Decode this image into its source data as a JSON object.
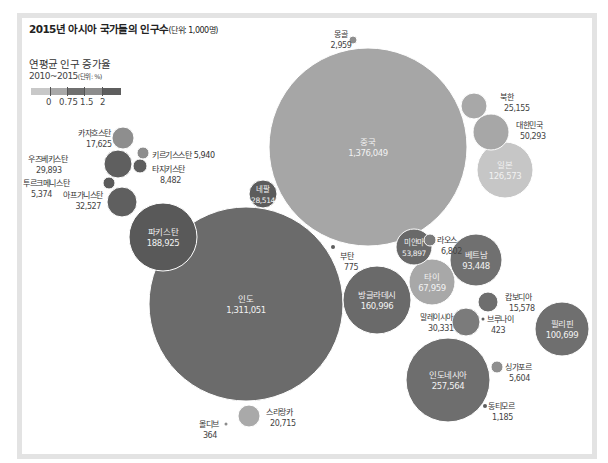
{
  "chart_data": {
    "type": "bubble",
    "title": "2015년 아시아 국가들의 인구수",
    "title_unit": "(단위: 1,000명)",
    "legend": {
      "title": "연평균 인구 증가율",
      "subtitle": "2010~2015",
      "subtitle_unit": "(단위: %)",
      "ticks": [
        "0",
        "0.75",
        "1.5",
        "2"
      ],
      "colors": [
        "#c8c8c8",
        "#a9a9a9",
        "#6f6f6f",
        "#8c8c8c",
        "#5e5e5e"
      ]
    },
    "series": [
      {
        "name": "중국",
        "value": "1,376,049",
        "x": 368,
        "y": 147,
        "r": 99,
        "color": "#a6a6a6",
        "label_inside": true
      },
      {
        "name": "인도",
        "value": "1,311,051",
        "x": 246,
        "y": 304,
        "r": 97,
        "color": "#6b6b6b",
        "label_inside": true
      },
      {
        "name": "파키스탄",
        "value": "188,925",
        "x": 163,
        "y": 237,
        "r": 34,
        "color": "#595959",
        "label_inside": true
      },
      {
        "name": "인도네시아",
        "value": "257,564",
        "x": 448,
        "y": 380,
        "r": 42,
        "color": "#6e6e6e",
        "label_inside": true
      },
      {
        "name": "방글라데시",
        "value": "160,996",
        "x": 377,
        "y": 300,
        "r": 34,
        "color": "#6a6a6a",
        "label_inside": true
      },
      {
        "name": "일본",
        "value": "126,573",
        "x": 505,
        "y": 170,
        "r": 28,
        "color": "#c6c6c6",
        "label_inside": true
      },
      {
        "name": "필리핀",
        "value": "100,699",
        "x": 562,
        "y": 329,
        "r": 27,
        "color": "#6f6f6f",
        "label_inside": true
      },
      {
        "name": "베트남",
        "value": "93,448",
        "x": 476,
        "y": 260,
        "r": 26,
        "color": "#707070",
        "label_inside": true
      },
      {
        "name": "타이",
        "value": "67,959",
        "x": 432,
        "y": 282,
        "r": 23,
        "color": "#a8a8a8",
        "label_inside": true
      },
      {
        "name": "미얀마",
        "value": "53,897",
        "x": 414,
        "y": 247,
        "r": 18,
        "color": "#696969",
        "label_inside": true
      },
      {
        "name": "대한민국",
        "value": "50,293",
        "x": 491,
        "y": 132,
        "r": 18,
        "color": "#a7a7a7",
        "label_inside": false,
        "lx": 516,
        "ly": 128,
        "anchor": "start"
      },
      {
        "name": "아프가니스탄",
        "value": "32,527",
        "x": 122,
        "y": 202,
        "r": 15,
        "color": "#5f5f5f",
        "label_inside": false,
        "lx": 103,
        "ly": 198,
        "anchor": "end"
      },
      {
        "name": "말레이시아",
        "value": "30,331",
        "x": 466,
        "y": 322,
        "r": 14,
        "color": "#7b7b7b",
        "label_inside": false,
        "lx": 420,
        "ly": 320,
        "anchor": "start"
      },
      {
        "name": "우즈베키스탄",
        "value": "29,893",
        "x": 118,
        "y": 164,
        "r": 14,
        "color": "#5f5f5f",
        "label_inside": false,
        "lx": 28,
        "ly": 162,
        "anchor": "start"
      },
      {
        "name": "네팔",
        "value": "28,514",
        "x": 263,
        "y": 194,
        "r": 14,
        "color": "#5c5c5c",
        "label_inside": true
      },
      {
        "name": "북한",
        "value": "25,155",
        "x": 474,
        "y": 106,
        "r": 13,
        "color": "#a8a8a8",
        "label_inside": false,
        "lx": 500,
        "ly": 100,
        "anchor": "start"
      },
      {
        "name": "스리랑카",
        "value": "20,715",
        "x": 249,
        "y": 416,
        "r": 11,
        "color": "#a9a9a9",
        "label_inside": false,
        "lx": 266,
        "ly": 415,
        "anchor": "start"
      },
      {
        "name": "카자흐스탄",
        "value": "17,625",
        "x": 123,
        "y": 138,
        "r": 11,
        "color": "#8e8e8e",
        "label_inside": false,
        "lx": 78,
        "ly": 136,
        "anchor": "start"
      },
      {
        "name": "캄보디아",
        "value": "15,578",
        "x": 488,
        "y": 302,
        "r": 10,
        "color": "#6e6e6e",
        "label_inside": false,
        "lx": 505,
        "ly": 300,
        "anchor": "start"
      },
      {
        "name": "타지키스탄",
        "value": "8,482",
        "x": 140,
        "y": 166,
        "r": 7,
        "color": "#5e5e5e",
        "label_inside": false,
        "lx": 152,
        "ly": 172,
        "anchor": "start"
      },
      {
        "name": "라오스",
        "value": "6,802",
        "x": 430,
        "y": 240,
        "r": 6,
        "color": "#7a7a7a",
        "label_inside": false,
        "lx": 437,
        "ly": 243,
        "anchor": "start"
      },
      {
        "name": "키르기스스탄",
        "value": "5,940",
        "x": 143,
        "y": 153,
        "r": 6,
        "color": "#8c8c8c",
        "label_inside": false,
        "lx": 152,
        "ly": 158,
        "anchor": "start",
        "inline": true
      },
      {
        "name": "싱가포르",
        "value": "5,604",
        "x": 497,
        "y": 367,
        "r": 6,
        "color": "#8e8e8e",
        "label_inside": false,
        "lx": 505,
        "ly": 370,
        "anchor": "start"
      },
      {
        "name": "투르크메니스탄",
        "value": "5,374",
        "x": 109,
        "y": 183,
        "r": 6,
        "color": "#5b5b5b",
        "label_inside": false,
        "lx": 23,
        "ly": 186,
        "anchor": "start"
      },
      {
        "name": "몽골",
        "value": "2,959",
        "x": 353,
        "y": 40,
        "r": 4,
        "color": "#8f8f8f",
        "label_inside": false,
        "lx": 341,
        "ly": 37,
        "anchor": "middle"
      },
      {
        "name": "동티모르",
        "value": "1,185",
        "x": 485,
        "y": 406,
        "r": 2,
        "color": "#5e5e5e",
        "label_inside": false,
        "lx": 488,
        "ly": 409,
        "anchor": "start"
      },
      {
        "name": "부탄",
        "value": "775",
        "x": 333,
        "y": 247,
        "r": 2,
        "color": "#5e5e5e",
        "label_inside": false,
        "lx": 340,
        "ly": 259,
        "anchor": "start"
      },
      {
        "name": "브루나이",
        "value": "423",
        "x": 483,
        "y": 319,
        "r": 1.5,
        "color": "#5e5e5e",
        "label_inside": false,
        "lx": 487,
        "ly": 322,
        "anchor": "start"
      },
      {
        "name": "몰디브",
        "value": "364",
        "x": 226,
        "y": 424,
        "r": 1.5,
        "color": "#8c8c8c",
        "label_inside": false,
        "lx": 219,
        "ly": 427,
        "anchor": "end"
      }
    ]
  }
}
